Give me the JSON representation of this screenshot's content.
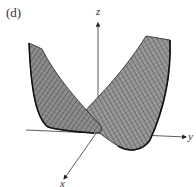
{
  "figure": {
    "panel_label": "(d)",
    "axes": {
      "x_label": "x",
      "y_label": "y",
      "z_label": "z"
    },
    "surface": {
      "description": "Saddle-like wireframe surface with two raised wings (left and right) meeting in a trough near the origin",
      "mesh_color": "#3a3a3a",
      "fill_color": "#8c8c8c"
    },
    "colors": {
      "background": "#ffffff",
      "axis": "#333333",
      "text": "#333333"
    }
  }
}
